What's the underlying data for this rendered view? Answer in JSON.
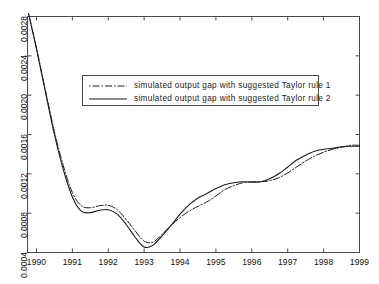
{
  "chart_data": {
    "type": "line",
    "title": "",
    "xlabel": "",
    "ylabel": "",
    "xlim": [
      1989.75,
      1999.0
    ],
    "ylim": [
      0.0004,
      0.0028
    ],
    "grid": false,
    "legend_position": "upper-center",
    "x_ticks": [
      "1990",
      "1991",
      "1992",
      "1993",
      "1994",
      "1995",
      "1996",
      "1997",
      "1998",
      "1999"
    ],
    "x_tick_values": [
      1990,
      1991,
      1992,
      1993,
      1994,
      1995,
      1996,
      1997,
      1998,
      1999
    ],
    "y_ticks": [
      "0.0004",
      "0.0008",
      "0.0012",
      "0.0016",
      "0.0020",
      "0.0024",
      "0.0028"
    ],
    "y_tick_values": [
      0.0004,
      0.0008,
      0.0012,
      0.0016,
      0.002,
      0.0024,
      0.0028
    ],
    "series": [
      {
        "name": "simulated output gap with suggested Taylor rule 1",
        "style": "dash-dot",
        "color": "#1a1a1a",
        "x": [
          1989.78,
          1990.0,
          1990.25,
          1990.5,
          1990.75,
          1991.0,
          1991.25,
          1991.5,
          1991.75,
          1992.0,
          1992.25,
          1992.5,
          1992.75,
          1993.0,
          1993.25,
          1993.5,
          1993.75,
          1994.0,
          1994.25,
          1994.5,
          1994.75,
          1995.0,
          1995.25,
          1995.5,
          1995.75,
          1996.0,
          1996.25,
          1996.5,
          1996.75,
          1997.0,
          1997.25,
          1997.5,
          1997.75,
          1998.0,
          1998.25,
          1998.5,
          1998.75,
          1999.0
        ],
        "y": [
          0.00283,
          0.00248,
          0.00205,
          0.00163,
          0.00128,
          0.00101,
          0.000875,
          0.000855,
          0.000875,
          0.00088,
          0.000835,
          0.000735,
          0.00062,
          0.000515,
          0.000505,
          0.000585,
          0.000675,
          0.000755,
          0.00082,
          0.00087,
          0.000915,
          0.000975,
          0.00104,
          0.00108,
          0.00111,
          0.00112,
          0.00112,
          0.00113,
          0.00116,
          0.00121,
          0.00127,
          0.00133,
          0.00138,
          0.00142,
          0.00145,
          0.00147,
          0.00149,
          0.00149
        ]
      },
      {
        "name": "simulated output gap with suggested Taylor rule 2",
        "style": "solid",
        "color": "#1a1a1a",
        "x": [
          1989.78,
          1990.0,
          1990.25,
          1990.5,
          1990.75,
          1991.0,
          1991.25,
          1991.5,
          1991.75,
          1992.0,
          1992.25,
          1992.5,
          1992.75,
          1993.0,
          1993.25,
          1993.5,
          1993.75,
          1994.0,
          1994.25,
          1994.5,
          1994.75,
          1995.0,
          1995.25,
          1995.5,
          1995.75,
          1996.0,
          1996.25,
          1996.5,
          1996.75,
          1997.0,
          1997.25,
          1997.5,
          1997.75,
          1998.0,
          1998.25,
          1998.5,
          1998.75,
          1999.0
        ],
        "y": [
          0.00283,
          0.00247,
          0.00203,
          0.0016,
          0.00124,
          0.000965,
          0.00082,
          0.000805,
          0.00083,
          0.000835,
          0.00079,
          0.000685,
          0.000555,
          0.000455,
          0.000475,
          0.00057,
          0.000675,
          0.00079,
          0.000885,
          0.000955,
          0.001,
          0.00105,
          0.00109,
          0.00111,
          0.00112,
          0.001115,
          0.00112,
          0.00115,
          0.0012,
          0.00127,
          0.00134,
          0.00139,
          0.00143,
          0.00145,
          0.00146,
          0.001475,
          0.00148,
          0.00148
        ]
      }
    ],
    "legend_entries": [
      {
        "label": "simulated output gap with suggested Taylor rule 1",
        "style": "dash-dot"
      },
      {
        "label": "simulated output gap with suggested Taylor rule 2",
        "style": "solid"
      }
    ]
  },
  "axis": {
    "frame_color": "#4a4a4a",
    "tick_color": "#4a4a4a"
  }
}
